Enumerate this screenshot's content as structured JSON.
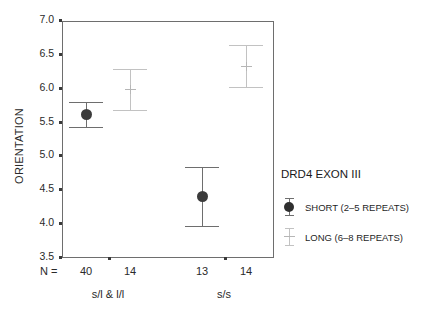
{
  "chart_data": {
    "type": "scatter",
    "title": "",
    "xlabel": "",
    "ylabel": "ORIENTATION",
    "ylim": [
      3.5,
      7.0
    ],
    "ytick_labels": [
      "7.0",
      "6.5",
      "6.0",
      "5.5",
      "5.0",
      "4.5",
      "4.0",
      "3.5"
    ],
    "ytick_values": [
      7.0,
      6.5,
      6.0,
      5.5,
      5.0,
      4.5,
      4.0,
      3.5
    ],
    "grid": false,
    "legend_position": "right",
    "categories": [
      "s/l & l/l",
      "s/s"
    ],
    "n_prefix": "N =",
    "n_values": [
      "40",
      "14",
      "13",
      "14"
    ],
    "series": [
      {
        "name": "SHORT (2–5 REPEATS)",
        "color": "#3b3b3b",
        "error_color": "#6e6e6e",
        "marker": "filled-circle",
        "points": [
          {
            "group": "s/l & l/l",
            "n": "40",
            "mean": 5.62,
            "upper": 5.8,
            "lower": 5.43
          },
          {
            "group": "s/s",
            "n": "13",
            "mean": 4.41,
            "upper": 4.85,
            "lower": 3.97
          }
        ]
      },
      {
        "name": "LONG (6–8 REPEATS)",
        "color": "#c2c2c2",
        "error_color": "#c2c2c2",
        "marker": "cross",
        "points": [
          {
            "group": "s/l & l/l",
            "n": "14",
            "mean": 5.99,
            "upper": 6.29,
            "lower": 5.68
          },
          {
            "group": "s/s",
            "n": "14",
            "mean": 6.33,
            "upper": 6.64,
            "lower": 6.02
          }
        ]
      }
    ]
  },
  "legend": {
    "title": "DRD4 EXON III",
    "entries": [
      {
        "label": "SHORT (2–5 REPEATS)"
      },
      {
        "label": "LONG (6–8 REPEATS)"
      }
    ]
  },
  "axis": {
    "y_title": "ORIENTATION",
    "n_prefix": "N ="
  },
  "colors": {
    "short": "#3b3b3b",
    "long": "#c2c2c2",
    "frame": "#6e6e6e",
    "text": "#1a1a1a"
  }
}
